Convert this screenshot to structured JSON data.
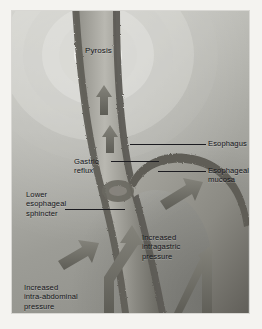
{
  "figure": {
    "background_color": "#9a9a95",
    "ink_color": "#15151a",
    "arrow_color": "#6f6f68",
    "mucosa_color": "#6b6a63"
  },
  "labels": {
    "pyrosis": "Pyrosis",
    "esophagus": "Esophagus",
    "esophageal_mucosa": "Esophageal\nmucosa",
    "lower_esophageal_sphincter": "Lower\nesophageal\nsphincter",
    "gastric_reflux": "Gastric\nreflux",
    "increased_intragastric_pressure": "Increased\nintragastric\npressure",
    "increased_intraabdominal_pressure": "Increased\nintra-abdominal\npressure"
  },
  "annotations": {
    "ring_count": 6,
    "reflux_arrow_count": 2,
    "pressure_arrow_count": 3
  }
}
